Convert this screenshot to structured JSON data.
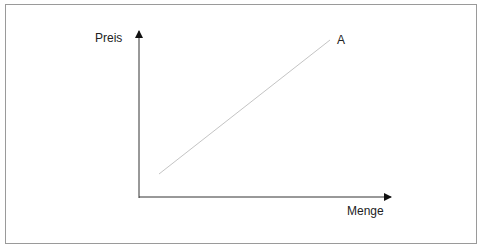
{
  "diagram": {
    "y_axis_label": "Preis",
    "x_axis_label": "Menge",
    "curve_label": "A",
    "colors": {
      "axis": "#111111",
      "curve": "#c0c0c0",
      "frame": "#9a9a9a"
    }
  }
}
